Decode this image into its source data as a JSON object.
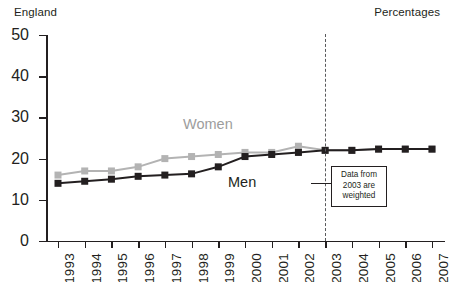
{
  "region_label": "England",
  "units_label": "Percentages",
  "series_labels": {
    "women": "Women",
    "men": "Men"
  },
  "annotation": {
    "line1": "Data from",
    "line2": "2003 are",
    "line3": "weighted",
    "marker_year": "2003"
  },
  "colors": {
    "men": "#231f20",
    "women": "#b3b3b3",
    "women_label": "#9d9d9d",
    "axis": "#231f20",
    "divider": "#58595b",
    "background": "#ffffff"
  },
  "chart_data": {
    "type": "line",
    "title": "",
    "subtitle": "",
    "xlabel": "",
    "ylabel": "",
    "units": "Percentages",
    "region": "England",
    "grid": false,
    "legend": "inline-labels",
    "ylim": [
      0,
      50
    ],
    "yticks": [
      0,
      10,
      20,
      30,
      40,
      50
    ],
    "ytick_labels": [
      "0",
      "10",
      "20",
      "30",
      "40",
      "50"
    ],
    "categories": [
      1993,
      1994,
      1995,
      1996,
      1997,
      1998,
      1999,
      2000,
      2001,
      2002,
      2003,
      2004,
      2005,
      2006,
      2007
    ],
    "xtick_labels": [
      "1993",
      "1994",
      "1995",
      "1996",
      "1997",
      "1998",
      "1999",
      "2000",
      "2001",
      "2002",
      "2003",
      "2004",
      "2005",
      "2006",
      "2007"
    ],
    "series": [
      {
        "name": "Women",
        "color": "#b3b3b3",
        "marker": "square",
        "values": [
          16.0,
          17.0,
          17.0,
          18.0,
          20.0,
          20.5,
          21.0,
          21.5,
          21.5,
          23.0,
          22.0,
          22.0,
          22.3,
          22.3,
          22.3
        ]
      },
      {
        "name": "Men",
        "color": "#231f20",
        "marker": "square",
        "values": [
          14.0,
          14.5,
          15.0,
          15.7,
          16.0,
          16.3,
          18.0,
          20.5,
          21.0,
          21.5,
          22.0,
          22.0,
          22.3,
          22.3,
          22.3
        ]
      }
    ],
    "annotations": [
      {
        "type": "vline",
        "x": 2003,
        "style": "dashed",
        "text": "Data from 2003 are weighted"
      }
    ]
  }
}
